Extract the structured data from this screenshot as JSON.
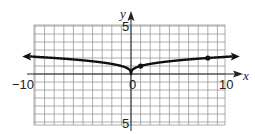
{
  "chart_data": {
    "type": "line",
    "title": "",
    "xlabel": "x",
    "ylabel": "y",
    "xlim": [
      -10,
      10
    ],
    "ylim": [
      -5,
      5
    ],
    "grid": true,
    "legend": null,
    "x_tick_labels": [
      {
        "value": -10,
        "label": "−10"
      },
      {
        "value": 0,
        "label": "0"
      },
      {
        "value": 10,
        "label": "10"
      }
    ],
    "y_tick_labels": [
      {
        "value": 5,
        "label": "5"
      },
      {
        "value": -5,
        "label": "−5"
      }
    ],
    "series": [
      {
        "name": "curve",
        "description": "y = cube root of |x|, cusp at origin, arrows at both ends",
        "x": [
          -10,
          -8,
          -6,
          -4,
          -2,
          -1,
          0,
          1,
          2,
          4,
          6,
          8,
          10
        ],
        "values": [
          2.15,
          2,
          1.82,
          1.59,
          1.26,
          1,
          0,
          1,
          1.26,
          1.59,
          1.82,
          2,
          2.15
        ]
      }
    ],
    "points": [
      {
        "x": 1,
        "y": 1
      },
      {
        "x": 8,
        "y": 2
      }
    ],
    "colors": {
      "curve": "#111111",
      "grid": "#9a9a9a",
      "axis": "#222222"
    }
  },
  "labels": {
    "x_axis": "x",
    "y_axis": "y",
    "x_min": "−10",
    "x_zero": "0",
    "x_max": "10",
    "y_max": "5",
    "y_min": "5"
  }
}
